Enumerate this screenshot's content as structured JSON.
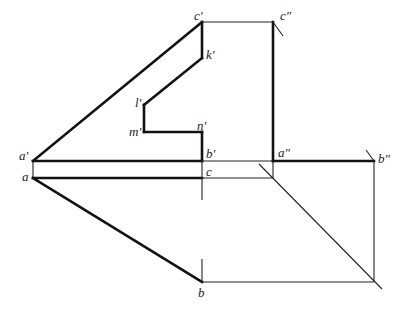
{
  "diagram": {
    "type": "descriptive-geometry-projection",
    "labels": {
      "c_prime": "c′",
      "c_dprime": "c″",
      "k_prime": "k′",
      "l_prime": "l′",
      "m_prime": "m′",
      "n_prime": "n′",
      "a_prime": "a′",
      "b_prime": "b′",
      "a_dprime": "a″",
      "b_dprime": "b″",
      "a": "a",
      "c": "c",
      "b": "b"
    },
    "points": {
      "c_prime": [
        202,
        22
      ],
      "c_dprime": [
        273,
        22
      ],
      "k_prime": [
        202,
        58
      ],
      "l_prime": [
        144,
        105
      ],
      "m_prime": [
        144,
        132
      ],
      "n_prime": [
        202,
        132
      ],
      "a_prime": [
        33,
        161
      ],
      "b_prime": [
        202,
        161
      ],
      "a_dprime": [
        273,
        161
      ],
      "b_dprime": [
        374,
        161
      ],
      "a": [
        33,
        178
      ],
      "c": [
        273,
        178
      ],
      "b": [
        202,
        282
      ]
    },
    "colors": {
      "line": "#111111",
      "background": "#ffffff"
    }
  }
}
